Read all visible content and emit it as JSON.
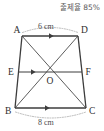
{
  "header": {
    "rate_text": "출제율 85%"
  },
  "figure": {
    "vertices": [
      {
        "name": "A",
        "label": "A",
        "x": 22,
        "y": 36
      },
      {
        "name": "D",
        "label": "D",
        "x": 78,
        "y": 36
      },
      {
        "name": "B",
        "label": "B",
        "x": 15,
        "y": 108
      },
      {
        "name": "C",
        "label": "C",
        "x": 86,
        "y": 108
      },
      {
        "name": "E",
        "label": "E",
        "x": 18.5,
        "y": 72
      },
      {
        "name": "F",
        "label": "F",
        "x": 82,
        "y": 72
      },
      {
        "name": "O",
        "label": "O",
        "x": 50.5,
        "y": 72
      }
    ],
    "edges": [
      {
        "name": "side-AD",
        "from": "A",
        "to": "D"
      },
      {
        "name": "side-AB",
        "from": "A",
        "to": "B"
      },
      {
        "name": "side-DC",
        "from": "D",
        "to": "C"
      },
      {
        "name": "side-BC",
        "from": "B",
        "to": "C"
      },
      {
        "name": "diagonal-AC",
        "from": "A",
        "to": "C"
      },
      {
        "name": "diagonal-BD",
        "from": "B",
        "to": "D"
      },
      {
        "name": "midline-EF",
        "from": "E",
        "to": "F"
      }
    ],
    "parallel_marks": [
      {
        "name": "arrow-mark-AD",
        "on": "AD"
      },
      {
        "name": "arrow-mark-EF",
        "on": "EF"
      },
      {
        "name": "arrow-mark-BC",
        "on": "BC"
      }
    ],
    "dimensions": [
      {
        "name": "dimension-AD",
        "label": "6 cm",
        "measures": "AD",
        "position": "above"
      },
      {
        "name": "dimension-BC",
        "label": "8 cm",
        "measures": "BC",
        "position": "below"
      }
    ]
  },
  "colors": {
    "stroke": "#3c3c3c",
    "guide": "#9a9a9a",
    "text": "#2e2e2e",
    "header_text": "#5a5a5a",
    "background": "#ffffff"
  }
}
